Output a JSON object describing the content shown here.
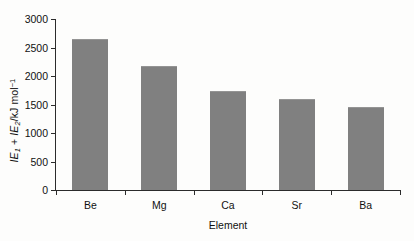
{
  "chart_data": {
    "type": "bar",
    "title": "",
    "subtitle": "",
    "categories": [
      "Be",
      "Mg",
      "Ca",
      "Sr",
      "Ba"
    ],
    "values": [
      2650,
      2180,
      1730,
      1600,
      1460
    ],
    "series": [
      {
        "name": "IE1 + IE2",
        "values": [
          2650,
          2180,
          1730,
          1600,
          1460
        ]
      }
    ],
    "xlabel": "Element",
    "ylabel": "IE1 + IE2/kJ mol-1",
    "ylabel_parts": {
      "ie": "IE",
      "sub1": "1",
      "plus": " + ",
      "sub2": "2",
      "units": "/kJ mol",
      "sup": "−1"
    },
    "ylim": [
      0,
      3000
    ],
    "ytick_labels": [
      "0",
      "500",
      "1000",
      "1500",
      "2000",
      "2500",
      "3000"
    ],
    "ytick_values": [
      0,
      500,
      1000,
      1500,
      2000,
      2500,
      3000
    ],
    "grid": false,
    "legend": false,
    "legend_position": "none",
    "bar_color": "#808080",
    "axis_color": "#2b2b2b",
    "text_color": "#111111",
    "background_color": "#fdfdfc"
  }
}
